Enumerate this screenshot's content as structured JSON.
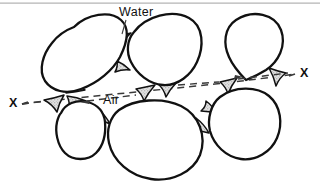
{
  "figure": {
    "kind": "diagram",
    "background_color": "#ffffff",
    "grain_outline_color": "#111111",
    "grain_fill_color": "#ffffff",
    "meniscus_fill_color": "#d8d8d8",
    "meniscus_outline_color": "#111111",
    "section_line_color": "#3a3a3a",
    "leader_line_color": "#3a3a3a",
    "top_rule_color": "#b4b4b4"
  },
  "labels": {
    "water": "Water",
    "air": "Air",
    "section_left": "X",
    "section_right": "X"
  },
  "annotations": [
    {
      "name": "water-callout",
      "text": "Water",
      "points_to": "capillary-meniscus-between-upper-left-and-upper-center-grains"
    },
    {
      "name": "air-callout",
      "text": "Air",
      "points_to": "open-pore-void-at-center"
    },
    {
      "name": "section-x-x",
      "text": "X - X",
      "description": "dashed section line passing through grain contacts"
    }
  ],
  "grains": [
    {
      "name": "grain-upper-left",
      "shape": "oval"
    },
    {
      "name": "grain-upper-center",
      "shape": "rounded-blob"
    },
    {
      "name": "grain-upper-right",
      "shape": "egg"
    },
    {
      "name": "grain-lower-left",
      "shape": "rounded-rectangle"
    },
    {
      "name": "grain-lower-center",
      "shape": "large-oval"
    },
    {
      "name": "grain-lower-right",
      "shape": "rounded-blob"
    }
  ],
  "menisci_count": 10
}
